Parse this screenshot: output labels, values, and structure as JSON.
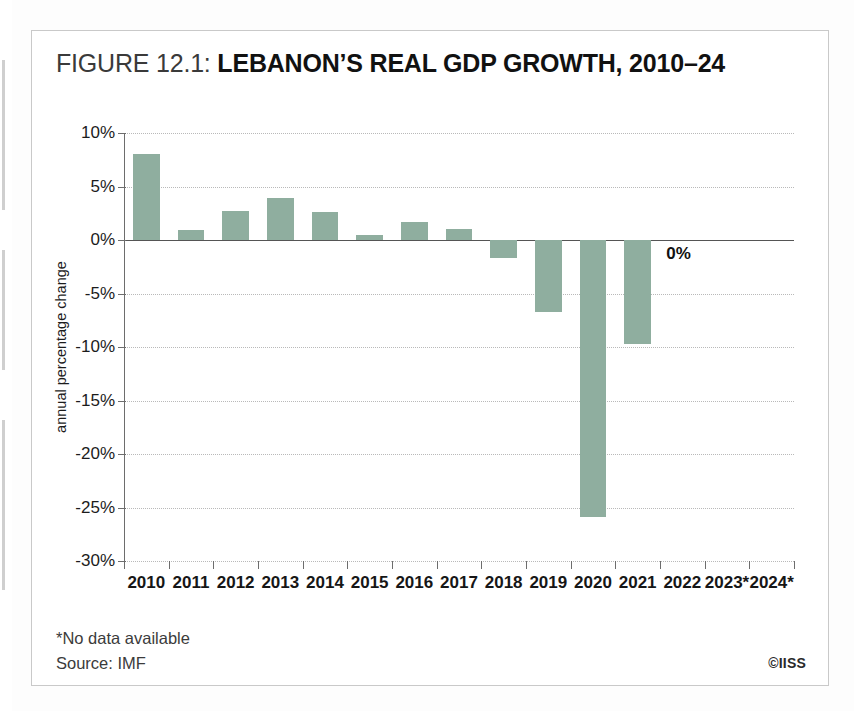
{
  "figure": {
    "label": "FIGURE 12.1:",
    "name": "LEBANON’S REAL GDP GROWTH, 2010–24",
    "footnote_1": "*No data available",
    "footnote_2": "Source: IMF",
    "credit": "©IISS",
    "bar_color": "#8fae9f",
    "grid_color": "#b9b9b9",
    "axis_color": "#6d6d6d"
  },
  "chart_data": {
    "type": "bar",
    "title": "FIGURE 12.1: LEBANON’S REAL GDP GROWTH, 2010–24",
    "xlabel": "",
    "ylabel": "annual percentage change",
    "ylim": [
      -30,
      10
    ],
    "ytick_labels": [
      "10%",
      "5%",
      "0%",
      "-5%",
      "-10%",
      "-15%",
      "-20%",
      "-25%",
      "-30%"
    ],
    "ytick_values": [
      10,
      5,
      0,
      -5,
      -10,
      -15,
      -20,
      -25,
      -30
    ],
    "grid": true,
    "legend": "none",
    "categories": [
      "2010",
      "2011",
      "2012",
      "2013",
      "2014",
      "2015",
      "2016",
      "2017",
      "2018",
      "2019",
      "2020",
      "2021",
      "2022",
      "2023*",
      "2024*"
    ],
    "values": [
      8.0,
      0.9,
      2.7,
      3.9,
      2.6,
      0.5,
      1.7,
      1.0,
      -1.7,
      -6.7,
      -25.9,
      -9.7,
      0,
      null,
      null
    ],
    "annotations": [
      {
        "category": "2022",
        "text": "0%",
        "value": 0
      }
    ],
    "notes": [
      "*No data available",
      "Source: IMF"
    ]
  }
}
